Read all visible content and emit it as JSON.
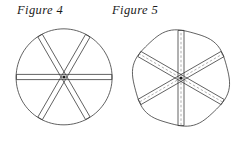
{
  "page": {
    "background_color": "#ffffff",
    "width": 242,
    "height": 141
  },
  "figures": [
    {
      "id": "figure-4",
      "caption": "Figure 4",
      "caption_position": {
        "x": 17,
        "y": 3
      },
      "outline_shape": "circle",
      "center": {
        "x": 64,
        "y": 77
      },
      "radius": 48,
      "stroke_color": "#3a3a3a",
      "stroke_width": 0.8,
      "strip_count": 3,
      "spoke_count": 6,
      "strip_half_width": 2.6,
      "strip_angles_deg": [
        0,
        60,
        120
      ],
      "strip_line_style": "solid",
      "has_dashed_centerline": false,
      "center_dot_color": "#1a1a1a",
      "description": "Circle crossed by three solid double-line strips through the center forming six spokes"
    },
    {
      "id": "figure-5",
      "caption": "Figure 5",
      "caption_position": {
        "x": 112,
        "y": 3
      },
      "outline_shape": "rounded-polygon",
      "center": {
        "x": 181,
        "y": 78
      },
      "radius": 48,
      "stroke_color": "#3a3a3a",
      "stroke_width": 0.8,
      "strip_count": 3,
      "spoke_count": 6,
      "strip_half_width": 3.0,
      "strip_angles_deg": [
        90,
        30,
        150
      ],
      "strip_line_style": "solid",
      "has_dashed_centerline": true,
      "dash_color": "#9a9a9a",
      "dash_pattern": "2.5 2",
      "center_dot_color": "#1a1a1a",
      "description": "Slightly flattened circle crossed by three strips, each with solid edges and a lighter dashed centerline"
    }
  ]
}
